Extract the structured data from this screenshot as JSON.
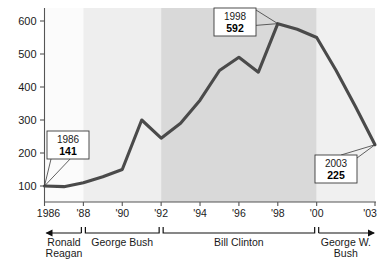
{
  "chart_data": {
    "type": "line",
    "title": "",
    "xlabel": "",
    "ylabel": "",
    "xlim": [
      1986,
      2003
    ],
    "ylim": [
      0,
      600
    ],
    "grid": false,
    "legend": "none",
    "x": [
      1986,
      1987,
      1988,
      1989,
      1990,
      1991,
      1992,
      1993,
      1994,
      1995,
      1996,
      1997,
      1998,
      1999,
      2000,
      2001,
      2002,
      2003
    ],
    "values": [
      100,
      98,
      110,
      128,
      150,
      300,
      245,
      290,
      360,
      450,
      490,
      445,
      592,
      575,
      550,
      450,
      340,
      225
    ],
    "y_ticks": [
      100,
      200,
      300,
      400,
      500,
      600
    ],
    "y_tick_labels": [
      "100",
      "200",
      "300",
      "400",
      "500",
      "600"
    ],
    "x_ticks": [
      1986,
      1988,
      1990,
      1992,
      1994,
      1996,
      1998,
      2000,
      2003
    ],
    "x_tick_labels": [
      "1986",
      "'88",
      "'90",
      "'92",
      "'94",
      "'96",
      "'98",
      "'00",
      "'03"
    ],
    "annotations": [
      {
        "name": "callout-1986",
        "year": "1986",
        "value": "141",
        "anchor_x": 1986,
        "anchor_y": 100
      },
      {
        "name": "callout-1998",
        "year": "1998",
        "value": "592",
        "anchor_x": 1998,
        "anchor_y": 592
      },
      {
        "name": "callout-2003",
        "year": "2003",
        "value": "225",
        "anchor_x": 2003,
        "anchor_y": 225
      }
    ],
    "bands": [
      {
        "name": "band-reagan",
        "from": 1986,
        "to": 1988,
        "color": "#fbfbfb"
      },
      {
        "name": "band-bush-sr",
        "from": 1988,
        "to": 1992,
        "color": "#eeeeee"
      },
      {
        "name": "band-clinton",
        "from": 1992,
        "to": 2000,
        "color": "#d9d9d9"
      },
      {
        "name": "band-bush-jr",
        "from": 2000,
        "to": 2003,
        "color": "#f0f0f0"
      }
    ],
    "eras": [
      {
        "name": "era-ronald-reagan",
        "lines": [
          "Ronald",
          "Reagan"
        ],
        "from": 1986,
        "to": 1988,
        "open_left": true,
        "open_right": false
      },
      {
        "name": "era-george-bush",
        "lines": [
          "George Bush"
        ],
        "from": 1988,
        "to": 1992,
        "open_left": false,
        "open_right": false
      },
      {
        "name": "era-bill-clinton",
        "lines": [
          "Bill Clinton"
        ],
        "from": 1992,
        "to": 2000,
        "open_left": false,
        "open_right": false
      },
      {
        "name": "era-george-w-bush",
        "lines": [
          "George W.",
          "Bush"
        ],
        "from": 2000,
        "to": 2003,
        "open_left": false,
        "open_right": true
      }
    ],
    "colors": {
      "line": "#4a4a4a",
      "axis": "#555555",
      "text": "#1a1a1a",
      "callout_border": "#3a3a3a",
      "callout_fill": "#ffffff"
    }
  }
}
